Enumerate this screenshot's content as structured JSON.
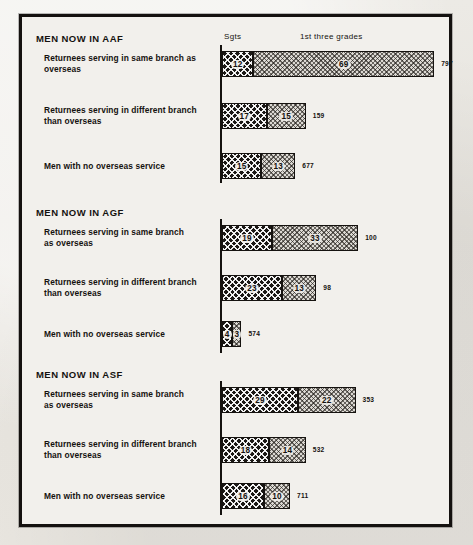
{
  "chart_data": {
    "type": "bar",
    "orientation": "horizontal",
    "stacked": true,
    "xlabel": "",
    "ylabel": "",
    "grid": false,
    "legend_position": "top",
    "column_headers": [
      "Sgts",
      "1st three grades"
    ],
    "series": [
      {
        "name": "Sgts",
        "pattern": "dark-crosshatch"
      },
      {
        "name": "1st three grades",
        "pattern": "light-stipple"
      }
    ],
    "sections": [
      {
        "title": "MEN NOW IN AAF",
        "rows": [
          {
            "label": "Returnees serving in same branch as\noverseas",
            "sgts": 12,
            "first_three_grades": 69,
            "total": "797"
          },
          {
            "label": "Returnees serving in different branch\nthan overseas",
            "sgts": 17,
            "first_three_grades": 15,
            "total": "159"
          },
          {
            "label": "Men with no overseas service",
            "sgts": 15,
            "first_three_grades": 13,
            "total": "677"
          }
        ]
      },
      {
        "title": "MEN NOW IN AGF",
        "rows": [
          {
            "label": "Returnees serving in same branch\nas overseas",
            "sgts": 19,
            "first_three_grades": 33,
            "total": "100"
          },
          {
            "label": "Returnees serving in different branch\nthan overseas",
            "sgts": 23,
            "first_three_grades": 13,
            "total": "98"
          },
          {
            "label": "Men with no overseas service",
            "sgts": 4,
            "first_three_grades": 3,
            "total": "574"
          }
        ]
      },
      {
        "title": "MEN NOW IN ASF",
        "rows": [
          {
            "label": "Returnees serving in same branch\nas overseas",
            "sgts": 29,
            "first_three_grades": 22,
            "total": "353"
          },
          {
            "label": "Returnees serving in different branch\nthan overseas",
            "sgts": 18,
            "first_three_grades": 14,
            "total": "532"
          },
          {
            "label": "Men with no overseas service",
            "sgts": 16,
            "first_three_grades": 10,
            "total": "711"
          }
        ]
      }
    ]
  }
}
